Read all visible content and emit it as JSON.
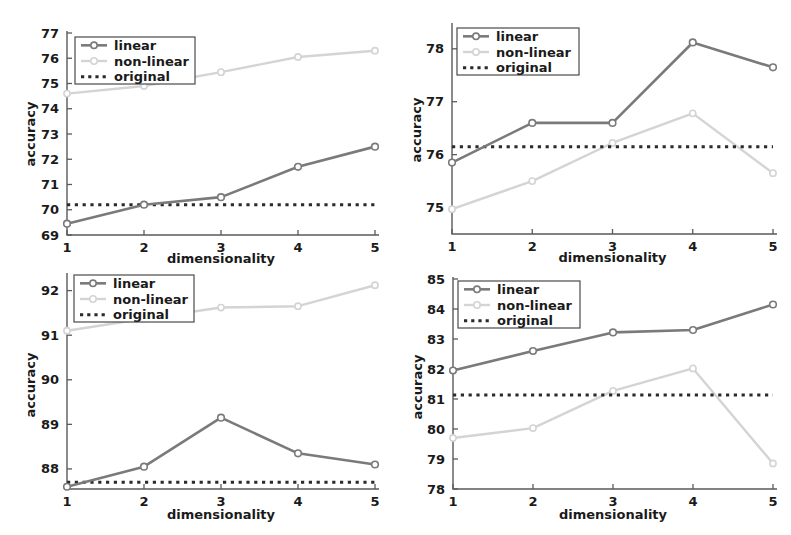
{
  "figure": {
    "background": "#ffffff",
    "width": 791,
    "height": 535,
    "panel_count": 4
  },
  "style": {
    "color_linear": "#7a7a7a",
    "color_nonlinear": "#d4d4d4",
    "color_original": "#2b2b2b",
    "color_axis": "#5a5a5a",
    "color_text": "#1a1a1a"
  },
  "legend": {
    "items": [
      {
        "label": "linear",
        "key": "linear",
        "style": "solid-marker"
      },
      {
        "label": "non-linear",
        "key": "nonlinear",
        "style": "solid-marker"
      },
      {
        "label": "original",
        "key": "original",
        "style": "dotted"
      }
    ]
  },
  "chart_data": [
    {
      "id": "panel-top-left",
      "type": "line",
      "title": "",
      "xlabel": "dimensionality",
      "ylabel": "accuracy",
      "x": [
        1,
        2,
        3,
        4,
        5
      ],
      "xticks": [
        1,
        2,
        3,
        4,
        5
      ],
      "yticks": [
        69,
        70,
        71,
        72,
        73,
        74,
        75,
        76,
        77
      ],
      "xlim": [
        1,
        5
      ],
      "ylim": [
        69,
        77
      ],
      "grid": false,
      "legend_position": "top-left",
      "series": [
        {
          "name": "linear",
          "values": [
            69.45,
            70.2,
            70.5,
            71.7,
            72.5
          ]
        },
        {
          "name": "non-linear",
          "values": [
            74.6,
            74.9,
            75.45,
            76.05,
            76.3
          ]
        },
        {
          "name": "original",
          "values": [
            70.2,
            70.2,
            70.2,
            70.2,
            70.2
          ],
          "constant": 70.2
        }
      ]
    },
    {
      "id": "panel-top-right",
      "type": "line",
      "title": "",
      "xlabel": "dimensionality",
      "ylabel": "accuracy",
      "x": [
        1,
        2,
        3,
        4,
        5
      ],
      "xticks": [
        1,
        2,
        3,
        4,
        5
      ],
      "yticks": [
        75,
        76,
        77,
        78
      ],
      "xlim": [
        1,
        5
      ],
      "ylim": [
        74.5,
        78.45
      ],
      "grid": false,
      "legend_position": "top-left",
      "series": [
        {
          "name": "linear",
          "values": [
            75.85,
            76.6,
            76.6,
            78.12,
            77.65
          ]
        },
        {
          "name": "non-linear",
          "values": [
            74.97,
            75.5,
            76.22,
            76.78,
            75.65
          ]
        },
        {
          "name": "original",
          "values": [
            76.15,
            76.15,
            76.15,
            76.15,
            76.15
          ],
          "constant": 76.15
        }
      ]
    },
    {
      "id": "panel-bottom-left",
      "type": "line",
      "title": "",
      "xlabel": "dimensionality",
      "ylabel": "accuracy",
      "x": [
        1,
        2,
        3,
        4,
        5
      ],
      "xticks": [
        1,
        2,
        3,
        4,
        5
      ],
      "yticks": [
        88,
        89,
        90,
        91,
        92
      ],
      "xlim": [
        1,
        5
      ],
      "ylim": [
        87.55,
        92.35
      ],
      "grid": false,
      "legend_position": "top-left",
      "series": [
        {
          "name": "linear",
          "values": [
            87.6,
            88.05,
            89.15,
            88.35,
            88.1
          ]
        },
        {
          "name": "non-linear",
          "values": [
            91.1,
            91.37,
            91.62,
            91.65,
            92.12
          ]
        },
        {
          "name": "original",
          "values": [
            87.7,
            87.7,
            87.7,
            87.7,
            87.7
          ],
          "constant": 87.7
        }
      ]
    },
    {
      "id": "panel-bottom-right",
      "type": "line",
      "title": "",
      "xlabel": "dimensionality",
      "ylabel": "accuracy",
      "x": [
        1,
        2,
        3,
        4,
        5
      ],
      "xticks": [
        1,
        2,
        3,
        4,
        5
      ],
      "yticks": [
        78,
        79,
        80,
        81,
        82,
        83,
        84,
        85
      ],
      "xlim": [
        1,
        5
      ],
      "ylim": [
        78,
        85
      ],
      "grid": false,
      "legend_position": "top-left",
      "series": [
        {
          "name": "linear",
          "values": [
            81.95,
            82.6,
            83.22,
            83.3,
            84.15
          ]
        },
        {
          "name": "non-linear",
          "values": [
            79.7,
            80.03,
            81.27,
            82.02,
            78.85
          ]
        },
        {
          "name": "original",
          "values": [
            81.13,
            81.13,
            81.13,
            81.13,
            81.13
          ],
          "constant": 81.13
        }
      ]
    }
  ]
}
